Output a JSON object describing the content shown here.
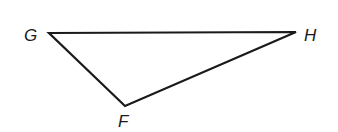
{
  "figure": {
    "type": "triangle",
    "name": "triangle FGH",
    "stroke_color": "#1a1a1a",
    "background": "#ffffff",
    "vertices": [
      {
        "label": "G",
        "x": 49,
        "y": 33,
        "label_x": 24,
        "label_y": 41
      },
      {
        "label": "H",
        "x": 296,
        "y": 32,
        "label_x": 304,
        "label_y": 41
      },
      {
        "label": "F",
        "x": 125,
        "y": 106,
        "label_x": 118,
        "label_y": 127
      }
    ],
    "edges": [
      {
        "from": "G",
        "to": "H"
      },
      {
        "from": "H",
        "to": "F"
      },
      {
        "from": "F",
        "to": "G"
      }
    ]
  }
}
